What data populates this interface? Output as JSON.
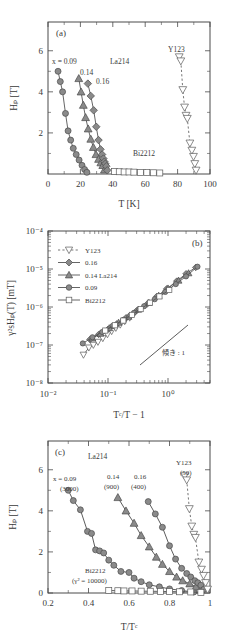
{
  "figure": {
    "panels": [
      "a",
      "b",
      "c"
    ],
    "marker_fill": "#8a8a8a",
    "marker_stroke": "#4a4a4a",
    "line_color": "#555555"
  },
  "panel_a": {
    "tag": "(a)",
    "xlabel": "T  [K]",
    "ylabel": "Hₚ  [T]",
    "xticks": [
      "0",
      "20",
      "40",
      "60",
      "80",
      "100"
    ],
    "yticks": [
      "2",
      "4",
      "6"
    ],
    "annotations": {
      "x_eq": "x = 0.09",
      "l014": "0.14",
      "l016": "0.16",
      "la214": "La214",
      "bi2212": "Bi2212",
      "y123": "Y123"
    }
  },
  "panel_b": {
    "tag": "(b)",
    "xlabel": "Tᶜ/T − 1",
    "ylabel": "γ²sHₚ(T)  [mT]",
    "xticks": [
      "10⁻²",
      "10⁻¹",
      "10⁰"
    ],
    "yticks": [
      "10⁻⁴",
      "10⁻⁵",
      "10⁻⁶",
      "10⁻⁷",
      "10⁻⁸"
    ],
    "slope_note": "傾き : 1",
    "legend": [
      {
        "label": "Y123",
        "marker": "triangle-down-open",
        "line": "dashed"
      },
      {
        "label": "0.16",
        "marker": "diamond-filled",
        "line": "solid"
      },
      {
        "label": "0.14 La214",
        "marker": "triangle-up-filled",
        "line": "solid"
      },
      {
        "label": "0.09",
        "marker": "circle-filled",
        "line": "solid"
      },
      {
        "label": "Bi2212",
        "marker": "square-open",
        "line": "solid"
      }
    ]
  },
  "panel_c": {
    "tag": "(c)",
    "xlabel": "T/Tᶜ",
    "ylabel": "Hₚ  [T]",
    "xticks": [
      "0.2",
      "0.4",
      "0.6",
      "0.8",
      "1"
    ],
    "yticks": [
      "0",
      "2",
      "4",
      "6"
    ],
    "annotations": {
      "la214": "La214",
      "x009": "x = 0.09",
      "x009_gamma": "(3000)",
      "x014": "0.14",
      "x014_gamma": "(900)",
      "x016": "0.16",
      "x016_gamma": "(400)",
      "y123": "Y123",
      "y123_gamma": "(50)",
      "bi2212": "Bi2212",
      "bi2212_gamma": "(γ² = 10000)"
    }
  },
  "chart_data": [
    {
      "type": "scatter",
      "panel": "a",
      "title": "",
      "xlabel": "T [K]",
      "ylabel": "Hp [T]",
      "xlim": [
        0,
        100
      ],
      "ylim": [
        0,
        7.4
      ],
      "grid": false,
      "series": [
        {
          "name": "La214 x = 0.09",
          "marker": "circle-filled",
          "x": [
            6.2,
            7.6,
            9.0,
            10.8,
            12.4,
            14.0,
            15.6,
            17.4,
            19.2,
            21.0,
            22.6,
            24.0
          ],
          "y": [
            5.0,
            4.5,
            4.0,
            2.95,
            2.1,
            1.65,
            1.25,
            0.95,
            0.68,
            0.42,
            0.22,
            0.08
          ]
        },
        {
          "name": "La214 x = 0.14",
          "marker": "triangle-up-filled",
          "x": [
            19.0,
            20.4,
            21.8,
            23.2,
            24.8,
            26.4,
            28.0,
            29.6,
            31.2,
            32.6,
            33.8,
            34.8
          ],
          "y": [
            4.65,
            4.0,
            3.35,
            2.75,
            2.2,
            1.7,
            1.3,
            0.95,
            0.72,
            0.55,
            0.42,
            0.2
          ]
        },
        {
          "name": "La214 x = 0.16",
          "marker": "diamond-filled",
          "x": [
            24.6,
            26.4,
            28.2,
            29.8,
            31.2,
            32.4,
            33.4,
            34.2,
            34.8,
            35.4,
            36.0,
            36.6
          ],
          "y": [
            4.4,
            3.8,
            3.1,
            2.3,
            1.65,
            1.2,
            0.95,
            0.75,
            0.6,
            0.5,
            0.38,
            0.18
          ]
        },
        {
          "name": "Bi2212",
          "marker": "square-open",
          "x": [
            41.0,
            44.0,
            47.0,
            50.0,
            53.0,
            57.0,
            61.0,
            65.0,
            69.0
          ],
          "y": [
            0.12,
            0.11,
            0.1,
            0.1,
            0.09,
            0.08,
            0.07,
            0.06,
            0.05
          ]
        },
        {
          "name": "Y123",
          "marker": "triangle-down-open",
          "line": "dashed",
          "x": [
            81.0,
            82.0,
            83.2,
            84.3,
            85.2,
            86.0,
            87.6,
            88.8,
            89.8,
            90.6,
            91.4
          ],
          "y": [
            5.7,
            5.5,
            4.1,
            3.25,
            2.85,
            2.7,
            1.5,
            1.15,
            0.85,
            0.5,
            0.18
          ]
        }
      ]
    },
    {
      "type": "scatter",
      "panel": "b",
      "title": "",
      "xlabel": "Tc/T - 1",
      "ylabel": "gamma^2 s Hp(T) [mT]",
      "xscale": "log",
      "yscale": "log",
      "xlim": [
        0.01,
        5
      ],
      "ylim": [
        1e-08,
        0.0001
      ],
      "grid": false,
      "note": "All datasets collapse onto a line of slope 1",
      "series": [
        {
          "name": "Y123",
          "marker": "triangle-down-open",
          "x": [
            0.039,
            0.048,
            0.057,
            0.068,
            0.082,
            0.098,
            0.115,
            0.135,
            0.16,
            0.19,
            0.23
          ],
          "y": [
            5.5e-08,
            8.5e-08,
            1e-07,
            1.2e-07,
            1.5e-07,
            1.9e-07,
            2.3e-07,
            2.8e-07,
            3.4e-07,
            4.2e-07,
            5.2e-07
          ]
        },
        {
          "name": "La214 0.16",
          "marker": "diamond-filled",
          "x": [
            0.05,
            0.07,
            0.1,
            0.14,
            0.2,
            0.3,
            0.45,
            0.65,
            0.95,
            1.4,
            2.0,
            2.9
          ],
          "y": [
            1.4e-07,
            1.9e-07,
            2.6e-07,
            3.6e-07,
            5.2e-07,
            8e-07,
            1.2e-06,
            1.9e-06,
            3e-06,
            4.8e-06,
            7.5e-06,
            1.1e-05
          ]
        },
        {
          "name": "La214 0.14",
          "marker": "triangle-up-filled",
          "x": [
            0.055,
            0.075,
            0.105,
            0.15,
            0.22,
            0.32,
            0.48,
            0.7,
            1.0,
            1.5,
            2.2
          ],
          "y": [
            1.5e-07,
            2e-07,
            2.8e-07,
            3.9e-07,
            5.6e-07,
            8.6e-07,
            1.3e-06,
            2e-06,
            3.1e-06,
            5e-06,
            7.8e-06
          ]
        },
        {
          "name": "La214 0.09",
          "marker": "circle-filled",
          "x": [
            0.038,
            0.055,
            0.08,
            0.12,
            0.18,
            0.27,
            0.4,
            0.6,
            0.9,
            1.35,
            2.0,
            3.1
          ],
          "y": [
            1.1e-07,
            1.6e-07,
            2.2e-07,
            3.2e-07,
            4.6e-07,
            7e-07,
            1.05e-06,
            1.6e-06,
            2.5e-06,
            4e-06,
            6.4e-06,
            1.15e-05
          ]
        },
        {
          "name": "Bi2212",
          "marker": "square-open",
          "x": [
            0.09,
            0.13,
            0.18,
            0.25,
            0.35,
            0.5,
            0.72,
            1.05
          ],
          "y": [
            2.4e-07,
            3.3e-07,
            4.4e-07,
            6.2e-07,
            8.8e-07,
            1.3e-06,
            1.9e-06,
            2.8e-06
          ]
        }
      ],
      "guide": {
        "label": "傾き : 1",
        "slope": 1
      }
    },
    {
      "type": "scatter",
      "panel": "c",
      "title": "",
      "xlabel": "T/Tc",
      "ylabel": "Hp [T]",
      "xlim": [
        0.2,
        1.0
      ],
      "ylim": [
        0,
        7.4
      ],
      "grid": false,
      "series": [
        {
          "name": "La214 x = 0.09 (3000)",
          "marker": "circle-filled",
          "x": [
            0.3,
            0.325,
            0.36,
            0.395,
            0.415,
            0.435,
            0.455,
            0.475,
            0.5,
            0.525,
            0.56,
            0.6,
            0.625,
            0.66,
            0.7,
            0.75,
            0.8,
            0.86,
            0.92
          ],
          "y": [
            5.0,
            4.5,
            4.05,
            3.0,
            2.9,
            2.1,
            2.05,
            1.95,
            1.6,
            1.35,
            1.05,
            1.0,
            0.72,
            0.55,
            0.4,
            0.3,
            0.2,
            0.12,
            0.05
          ]
        },
        {
          "name": "La214 x = 0.14 (900)",
          "marker": "triangle-up-filled",
          "x": [
            0.545,
            0.585,
            0.625,
            0.66,
            0.7,
            0.735,
            0.765,
            0.8,
            0.835,
            0.865,
            0.9,
            0.93,
            0.955
          ],
          "y": [
            4.65,
            4.0,
            3.4,
            2.8,
            2.25,
            1.75,
            1.4,
            1.05,
            0.78,
            0.6,
            0.45,
            0.3,
            0.14
          ]
        },
        {
          "name": "La214 x = 0.16 (400)",
          "marker": "circle-filled",
          "x": [
            0.695,
            0.73,
            0.765,
            0.8,
            0.83,
            0.86,
            0.885,
            0.905,
            0.925,
            0.94,
            0.955,
            0.97
          ],
          "y": [
            4.45,
            3.85,
            3.2,
            2.3,
            1.65,
            1.2,
            0.95,
            0.78,
            0.6,
            0.5,
            0.38,
            0.18
          ]
        },
        {
          "name": "Bi2212 (gamma^2 = 10000)",
          "marker": "square-open",
          "x": [
            0.5,
            0.545,
            0.575,
            0.615,
            0.66,
            0.705,
            0.755,
            0.8,
            0.85,
            0.905,
            0.955
          ],
          "y": [
            0.12,
            0.11,
            0.1,
            0.1,
            0.09,
            0.085,
            0.08,
            0.07,
            0.06,
            0.05,
            0.03
          ]
        },
        {
          "name": "Y123 (50)",
          "marker": "triangle-down-open",
          "line": "dashed",
          "x": [
            0.875,
            0.885,
            0.898,
            0.91,
            0.92,
            0.928,
            0.945,
            0.958,
            0.968,
            0.978,
            0.988
          ],
          "y": [
            5.7,
            5.5,
            4.1,
            3.25,
            2.85,
            2.7,
            1.5,
            1.15,
            0.85,
            0.5,
            0.18
          ]
        }
      ]
    }
  ]
}
